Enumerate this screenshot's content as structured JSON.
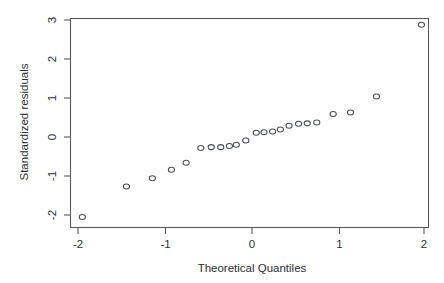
{
  "chart_data": {
    "type": "scatter",
    "title": "",
    "xlabel": "Theoretical Quantiles",
    "ylabel": "Standardized residuals",
    "xlim": [
      -2.18,
      2.12
    ],
    "ylim": [
      -2.32,
      3.22
    ],
    "xticks": [
      -2,
      -1,
      0,
      1,
      2
    ],
    "xtick_labels": [
      "-2",
      "-1",
      "0",
      "1",
      "2"
    ],
    "yticks": [
      -2,
      -1,
      0,
      1,
      2,
      3
    ],
    "ytick_labels": [
      "-2",
      "-1",
      "0",
      "1",
      "2",
      "3"
    ],
    "grid": false,
    "legend": null,
    "marker": "open-circle",
    "series": [
      {
        "name": "Standardized residuals",
        "x": [
          -1.95,
          -1.44,
          -1.14,
          -0.92,
          -0.75,
          -0.58,
          -0.46,
          -0.35,
          -0.25,
          -0.17,
          -0.06,
          0.06,
          0.15,
          0.25,
          0.34,
          0.44,
          0.55,
          0.65,
          0.76,
          0.95,
          1.15,
          1.45,
          1.97
        ],
        "y": [
          -2.05,
          -1.27,
          -1.06,
          -0.84,
          -0.66,
          -0.28,
          -0.26,
          -0.26,
          -0.23,
          -0.2,
          -0.09,
          0.11,
          0.12,
          0.14,
          0.19,
          0.29,
          0.34,
          0.35,
          0.37,
          0.59,
          0.63,
          1.04,
          2.88
        ]
      }
    ]
  },
  "axis": {
    "x_title": "Theoretical Quantiles",
    "y_title": "Standardized residuals",
    "x_tick_labels": [
      "-2",
      "-1",
      "0",
      "1",
      "2"
    ],
    "y_tick_labels": [
      "-2",
      "-1",
      "0",
      "1",
      "2",
      "3"
    ]
  },
  "style": {
    "background": "#ffffff",
    "axis_color": "#555a5e",
    "marker_color": "#4a4f55",
    "text_color": "#2b2f33"
  }
}
